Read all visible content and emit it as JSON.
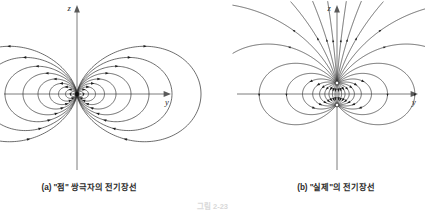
{
  "figure": {
    "number_label": "그림 2-23",
    "panels": [
      {
        "id": "a",
        "caption": "(a) \"점\" 쌍극자의 전기장선",
        "axis_vertical_label": "z",
        "axis_horizontal_label": "y",
        "dipole_type": "point",
        "charge_separation": 0,
        "description": "이상적인 점 쌍극자의 전기장선"
      },
      {
        "id": "b",
        "caption": "(b) \"실제\"의 전기장선",
        "axis_vertical_label": "z",
        "axis_horizontal_label": "y",
        "dipole_type": "physical",
        "charge_separation": 22,
        "description": "유한한 간격의 실제 쌍극자의 전기장선"
      }
    ]
  },
  "colors": {
    "background": "#ffffff",
    "field_line": "#333333",
    "axis": "#6e6e6e",
    "arrow": "#1d1d1d",
    "caption_text": "#2a2a2a"
  }
}
